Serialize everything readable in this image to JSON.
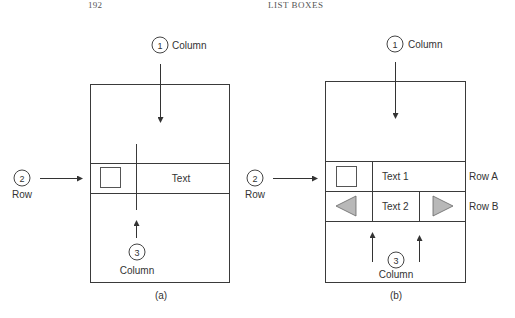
{
  "header": {
    "page_number": "192",
    "chapter_title": "LIST BOXES"
  },
  "figure_a": {
    "caption": "(a)",
    "callout_1": {
      "number": "1",
      "label": "Column"
    },
    "callout_2": {
      "number": "2",
      "label": "Row"
    },
    "callout_3": {
      "number": "3",
      "label": "Column"
    },
    "row": {
      "text": "Text",
      "has_checkbox": true
    }
  },
  "figure_b": {
    "caption": "(b)",
    "callout_1": {
      "number": "1",
      "label": "Column"
    },
    "callout_2": {
      "number": "2",
      "label": "Row"
    },
    "callout_3": {
      "number": "3",
      "label": "Column"
    },
    "rows": [
      {
        "name": "Row A",
        "text": "Text 1",
        "left_icon": "checkbox",
        "right_icon": null
      },
      {
        "name": "Row B",
        "text": "Text 2",
        "left_icon": "left-triangle",
        "right_icon": "right-triangle"
      }
    ]
  },
  "colors": {
    "line": "#3a3a3a",
    "triangle_fill": "#b8b8b8",
    "text": "#333333"
  }
}
